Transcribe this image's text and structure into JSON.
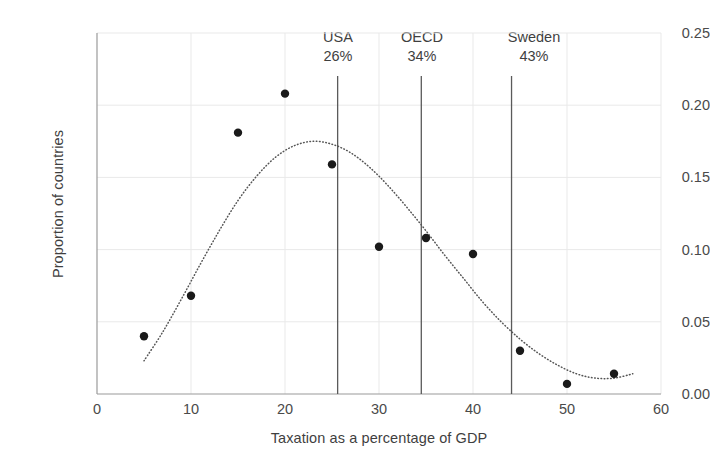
{
  "chart_data": {
    "type": "scatter",
    "title": "",
    "subtitle": "",
    "xlabel": "Taxation as a percentage of GDP",
    "ylabel": "Proportion of countries",
    "xlim": [
      0,
      60
    ],
    "ylim": [
      0.0,
      0.25
    ],
    "xticks": [
      "0",
      "10",
      "20",
      "30",
      "40",
      "50",
      "60"
    ],
    "xtick_values": [
      0,
      10,
      20,
      30,
      40,
      50,
      60
    ],
    "yticks": [
      "0.00",
      "0.05",
      "0.10",
      "0.15",
      "0.20",
      "0.25"
    ],
    "ytick_values": [
      0.0,
      0.05,
      0.1,
      0.15,
      0.2,
      0.25
    ],
    "grid": "horizontal-and-vertical-light",
    "legend": "none",
    "x": [
      5,
      10,
      15,
      20,
      25,
      30,
      35,
      40,
      45,
      50,
      55
    ],
    "values": [
      0.04,
      0.068,
      0.181,
      0.208,
      0.159,
      0.102,
      0.108,
      0.097,
      0.03,
      0.007,
      0.014
    ],
    "series": [
      {
        "name": "Proportion of countries",
        "type": "scatter",
        "marker": "filled-circle",
        "color": "#1a1a1a",
        "x": [
          5,
          10,
          15,
          20,
          25,
          30,
          35,
          40,
          45,
          50,
          55
        ],
        "values": [
          0.04,
          0.068,
          0.181,
          0.208,
          0.159,
          0.102,
          0.108,
          0.097,
          0.03,
          0.007,
          0.014
        ]
      },
      {
        "name": "Fitted distribution curve",
        "type": "line",
        "linestyle": "dotted",
        "color": "#555555",
        "x": [
          5,
          7,
          9,
          11,
          13,
          15,
          17,
          19,
          21,
          23,
          25,
          27,
          29,
          31,
          33,
          35,
          37,
          39,
          41,
          43,
          45,
          47,
          49,
          51,
          53,
          55,
          57
        ],
        "values": [
          0.023,
          0.043,
          0.066,
          0.09,
          0.113,
          0.134,
          0.151,
          0.164,
          0.172,
          0.175,
          0.173,
          0.167,
          0.157,
          0.144,
          0.129,
          0.113,
          0.096,
          0.08,
          0.064,
          0.05,
          0.038,
          0.028,
          0.02,
          0.014,
          0.011,
          0.011,
          0.014
        ]
      }
    ],
    "reference_lines": [
      {
        "name": "USA",
        "value_label": "26%",
        "x": 25.6
      },
      {
        "name": "OECD",
        "value_label": "34%",
        "x": 34.5
      },
      {
        "name": "Sweden",
        "value_label": "43%",
        "x": 44.1
      }
    ],
    "colors": {
      "marker": "#1a1a1a",
      "curve": "#555555",
      "axis": "#9a9a9a",
      "grid": "#e9e9e9",
      "reference_line": "#5a5a5a",
      "text": "#3f3f3f",
      "background": "#ffffff"
    }
  }
}
